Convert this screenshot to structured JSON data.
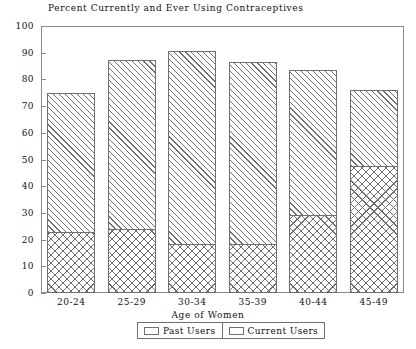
{
  "chart_data": {
    "type": "bar",
    "stacked": true,
    "title": "Percent Currently and Ever Using Contraceptives",
    "xlabel": "Age of Women",
    "ylabel": "",
    "ylim": [
      0,
      100
    ],
    "yticks": [
      0,
      10,
      20,
      30,
      40,
      50,
      60,
      70,
      80,
      90,
      100
    ],
    "grid": false,
    "legend_position": "bottom",
    "categories": [
      "20-24",
      "25-29",
      "30-34",
      "35-39",
      "40-44",
      "45-49"
    ],
    "series": [
      {
        "name": "Past Users",
        "pattern": "cross-hatch",
        "values": [
          22.8,
          24.0,
          18.3,
          18.3,
          29.2,
          47.6
        ]
      },
      {
        "name": "Current Users",
        "pattern": "diagonal-hatch",
        "values": [
          52.1,
          63.3,
          72.3,
          68.2,
          54.3,
          28.4
        ]
      }
    ],
    "totals": [
      74.9,
      87.3,
      90.6,
      86.5,
      83.5,
      76.0
    ]
  },
  "legend": {
    "items": [
      {
        "label": "Past Users"
      },
      {
        "label": "Current Users"
      }
    ]
  },
  "colors": {
    "axis": "#8a8a8a",
    "bar_outline": "#6f6f6f",
    "hatch": "#6f6f6f",
    "text": "#111111",
    "background": "#ffffff"
  }
}
